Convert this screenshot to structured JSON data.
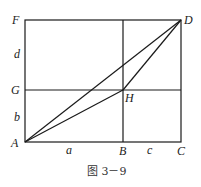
{
  "diagram": {
    "points": {
      "F": {
        "label": "F",
        "x": 25,
        "y": 20
      },
      "D": {
        "label": "D",
        "x": 181,
        "y": 20
      },
      "G": {
        "label": "G",
        "x": 25,
        "y": 90
      },
      "H": {
        "label": "H",
        "x": 123,
        "y": 90
      },
      "A": {
        "label": "A",
        "x": 25,
        "y": 142
      },
      "B": {
        "label": "B",
        "x": 123,
        "y": 142
      },
      "C": {
        "label": "C",
        "x": 181,
        "y": 142
      }
    },
    "segment_labels": {
      "d": "d",
      "b": "b",
      "a": "a",
      "c": "c"
    },
    "segments": [
      [
        "A",
        "C"
      ],
      [
        "C",
        "D"
      ],
      [
        "D",
        "F"
      ],
      [
        "F",
        "A"
      ],
      [
        "G",
        "H"
      ],
      [
        "H",
        "(right edge)"
      ],
      [
        "B",
        "(top edge)"
      ],
      [
        "A",
        "D"
      ],
      [
        "A",
        "H"
      ],
      [
        "H",
        "D"
      ]
    ],
    "caption": "图 3－9"
  }
}
